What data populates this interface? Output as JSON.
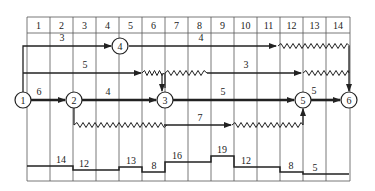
{
  "diagram": {
    "type": "time-scaled network diagram with resource histogram",
    "columns": [
      "1",
      "2",
      "3",
      "4",
      "5",
      "6",
      "7",
      "8",
      "9",
      "10",
      "11",
      "12",
      "13",
      "14"
    ],
    "nodes": [
      {
        "id": "1",
        "label": "1"
      },
      {
        "id": "2",
        "label": "2"
      },
      {
        "id": "3",
        "label": "3"
      },
      {
        "id": "4",
        "label": "4"
      },
      {
        "id": "5",
        "label": "5"
      },
      {
        "id": "6",
        "label": "6"
      }
    ],
    "activities": [
      {
        "from": "1",
        "to": "4",
        "label": "3"
      },
      {
        "from": "4",
        "to": "6",
        "label": "4"
      },
      {
        "from": "1",
        "to": "3",
        "label": "5"
      },
      {
        "from": "3",
        "to": "6",
        "label": "3"
      },
      {
        "from": "1",
        "to": "2",
        "label": "6"
      },
      {
        "from": "2",
        "to": "3",
        "label": "4"
      },
      {
        "from": "3",
        "to": "5",
        "label": "5"
      },
      {
        "from": "5",
        "to": "6",
        "label": "5"
      },
      {
        "from": "2",
        "to": "5",
        "label": "7"
      }
    ],
    "histogram": {
      "segments": [
        {
          "start_col": 1,
          "end_col": 2,
          "value": "14"
        },
        {
          "start_col": 3,
          "end_col": 4,
          "value": "12"
        },
        {
          "start_col": 5,
          "end_col": 5,
          "value": "13"
        },
        {
          "start_col": 6,
          "end_col": 6,
          "value": "8"
        },
        {
          "start_col": 7,
          "end_col": 8,
          "value": "16"
        },
        {
          "start_col": 9,
          "end_col": 9,
          "value": "19"
        },
        {
          "start_col": 10,
          "end_col": 11,
          "value": "12"
        },
        {
          "start_col": 12,
          "end_col": 12,
          "value": "8"
        },
        {
          "start_col": 13,
          "end_col": 14,
          "value": "5"
        }
      ]
    },
    "colors": {
      "line": "#222222",
      "grid": "#555555",
      "background": "#ffffff"
    }
  }
}
